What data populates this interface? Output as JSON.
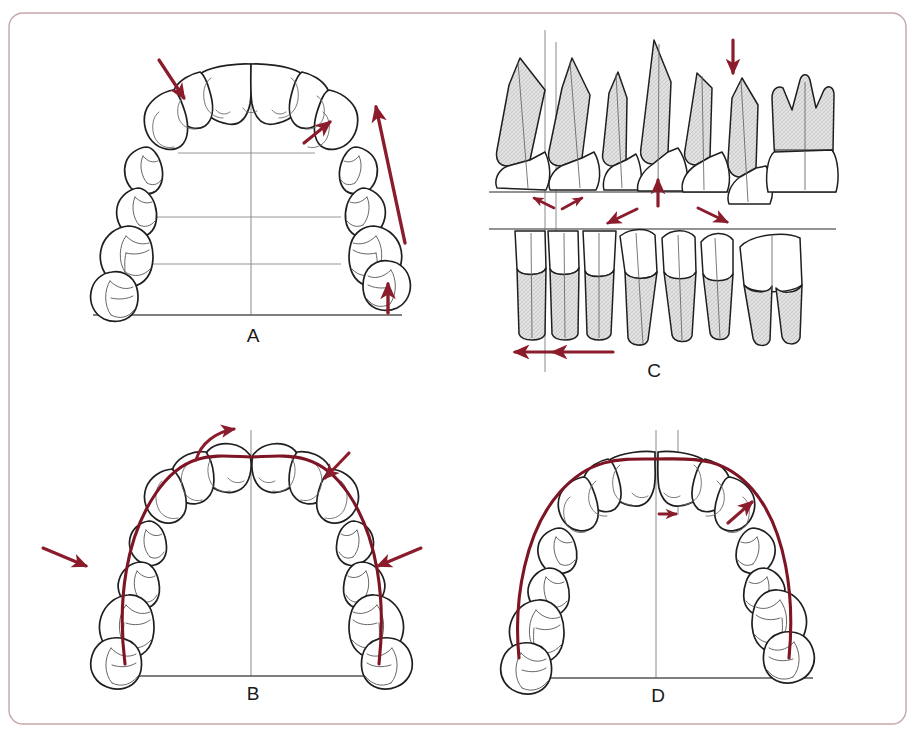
{
  "figure": {
    "border_color": "#c8a7ab",
    "background_color": "#ffffff",
    "outline_color": "#1f1f1f",
    "reference_line_color": "#808080",
    "arrow_color": "#8b1c2b",
    "arch_curve_color": "#7d1524",
    "root_shading_color": "#d9d9d9",
    "label_color": "#1a1a1a"
  },
  "panels": [
    {
      "id": "A",
      "label": "A",
      "view": "maxillary-occlusal",
      "description": "Occlusal view of the upper dental arch with a vertical midline, three horizontal transverse reference lines and a horizontal baseline. Dark red arrows indicate directions of tooth movement.",
      "teeth_count": 14,
      "reference_lines": {
        "midline": true,
        "horizontal_count": 3,
        "baseline": true
      },
      "arrows": [
        {
          "name": "left-lateral-incisor-arrow",
          "type": "straight",
          "direction": "down-right"
        },
        {
          "name": "right-canine-arrow",
          "type": "straight",
          "direction": "up-right"
        },
        {
          "name": "right-posterior-long-arrow",
          "type": "straight-long",
          "direction": "up"
        },
        {
          "name": "right-molar-vertical-arrow",
          "type": "straight",
          "direction": "up"
        }
      ]
    },
    {
      "id": "B",
      "label": "B",
      "view": "maxillary-occlusal",
      "description": "Occlusal view of the upper dental arch with a superimposed dark red arch-form curve, a vertical midline and a horizontal baseline. Arrows show constriction and rotation of teeth relative to the ideal arch form.",
      "teeth_count": 14,
      "reference_lines": {
        "midline": true,
        "horizontal_count": 0,
        "baseline": true
      },
      "arch_curve": true,
      "arrows": [
        {
          "name": "left-central-incisor-rotation-arrow",
          "type": "curved",
          "direction": "clockwise"
        },
        {
          "name": "right-canine-inward-arrow",
          "type": "straight",
          "direction": "down-left"
        },
        {
          "name": "left-premolar-inward-arrow",
          "type": "straight",
          "direction": "right"
        },
        {
          "name": "right-premolar-inward-arrow",
          "type": "straight",
          "direction": "left"
        }
      ]
    },
    {
      "id": "C",
      "label": "C",
      "view": "frontal-roots",
      "description": "Frontal view of the upper and lower teeth with roots shown. Two horizontal occlusal reference lines and vertical midlines. Dark red arrows show intrusion, extrusion and mesiodistal shifts of the dentition.",
      "upper_teeth_count": 7,
      "lower_teeth_count": 8,
      "reference_lines": {
        "midline": true,
        "horizontal_count": 2,
        "baseline": false
      },
      "arrows": [
        {
          "name": "upper-canine-intrusion-arrow",
          "type": "straight",
          "direction": "down"
        },
        {
          "name": "upper-central-incisor-extrusion-arrow",
          "type": "straight",
          "direction": "up"
        },
        {
          "name": "upper-midline-left-shift-arrow",
          "type": "straight-small",
          "direction": "left"
        },
        {
          "name": "upper-midline-right-shift-arrow",
          "type": "straight-small",
          "direction": "up-right"
        },
        {
          "name": "lower-left-arch-arrow",
          "type": "straight",
          "direction": "down-left"
        },
        {
          "name": "lower-right-arch-arrow",
          "type": "straight",
          "direction": "down-right"
        },
        {
          "name": "lower-midline-shift-arrow-outer",
          "type": "straight",
          "direction": "left"
        },
        {
          "name": "lower-midline-shift-arrow-inner",
          "type": "straight-long",
          "direction": "left"
        }
      ]
    },
    {
      "id": "D",
      "label": "D",
      "view": "maxillary-occlusal",
      "description": "Occlusal view of the upper dental arch with a superimposed dark red arch-form curve, two vertical midlines showing a midline discrepancy, and a horizontal baseline. Arrows show the direction of midline correction and arch expansion.",
      "teeth_count": 14,
      "reference_lines": {
        "midline": true,
        "second_midline": true,
        "horizontal_count": 0,
        "baseline": true
      },
      "arch_curve": true,
      "arrows": [
        {
          "name": "midline-correction-arrow",
          "type": "straight-small",
          "direction": "right"
        },
        {
          "name": "right-posterior-expansion-arrow",
          "type": "straight",
          "direction": "up-right"
        }
      ]
    }
  ]
}
